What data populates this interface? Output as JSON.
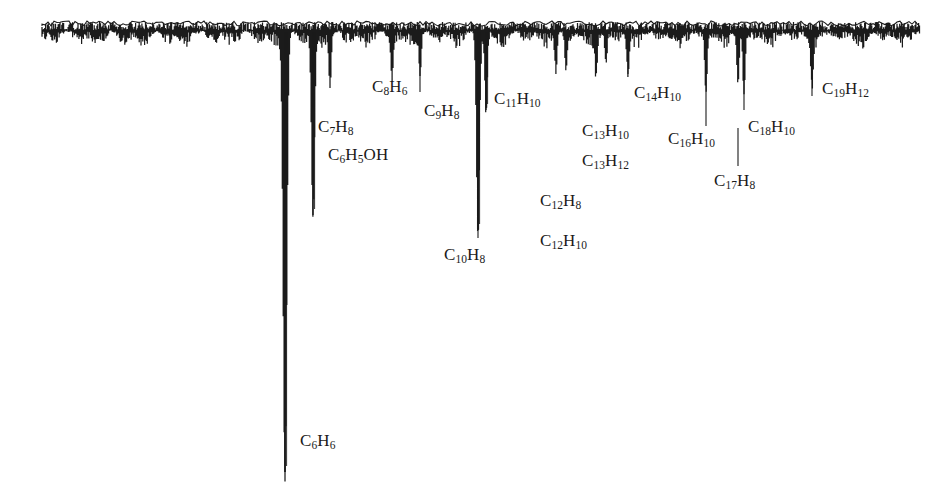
{
  "figure": {
    "kind": "gas-chromatogram",
    "orientation": "inverted-peaks-downward",
    "ink_color": "#1b1b1b",
    "background_color": "#ffffff",
    "baseline_y": 30,
    "trace_start_x": 42,
    "trace_end_x": 920
  },
  "labels": [
    {
      "name": "c6h6",
      "text": "C6H6",
      "formula": [
        [
          "C",
          ""
        ],
        [
          "",
          6
        ],
        [
          "H",
          ""
        ],
        [
          "",
          6
        ]
      ],
      "x": 300,
      "y": 432,
      "leader_x": 285,
      "leader_y1": 408,
      "leader_y2": 472
    },
    {
      "name": "c7h8",
      "text": "C7H8",
      "formula": [
        [
          "C",
          ""
        ],
        [
          "",
          7
        ],
        [
          "H",
          ""
        ],
        [
          "",
          8
        ]
      ],
      "x": 318,
      "y": 118,
      "leader_x": 313,
      "leader_y1": 62,
      "leader_y2": 108
    },
    {
      "name": "c6h5oh",
      "text": "C6H5OH",
      "formula": [
        [
          "C",
          ""
        ],
        [
          "",
          6
        ],
        [
          "H",
          ""
        ],
        [
          "",
          5
        ],
        [
          "OH",
          ""
        ]
      ],
      "x": 328,
      "y": 146,
      "leader_x": null,
      "leader_y1": null,
      "leader_y2": null
    },
    {
      "name": "c8h6",
      "text": "C8H6",
      "formula": [
        [
          "C",
          ""
        ],
        [
          "",
          8
        ],
        [
          "H",
          ""
        ],
        [
          "",
          6
        ]
      ],
      "x": 372,
      "y": 78,
      "leader_x": null,
      "leader_y1": null,
      "leader_y2": null
    },
    {
      "name": "c9h8",
      "text": "C9H8",
      "formula": [
        [
          "C",
          ""
        ],
        [
          "",
          9
        ],
        [
          "H",
          ""
        ],
        [
          "",
          8
        ]
      ],
      "x": 424,
      "y": 102,
      "leader_x": 420,
      "leader_y1": 58,
      "leader_y2": 92
    },
    {
      "name": "c10h8",
      "text": "C10H8",
      "formula": [
        [
          "C",
          ""
        ],
        [
          "",
          10
        ],
        [
          "H",
          ""
        ],
        [
          "",
          8
        ]
      ],
      "x": 444,
      "y": 246,
      "leader_x": 478,
      "leader_y1": 196,
      "leader_y2": 238
    },
    {
      "name": "c11h10",
      "text": "C11H10",
      "formula": [
        [
          "C",
          ""
        ],
        [
          "",
          11
        ],
        [
          "H",
          ""
        ],
        [
          "",
          10
        ]
      ],
      "x": 494,
      "y": 90,
      "leader_x": 486,
      "leader_y1": 40,
      "leader_y2": 108
    },
    {
      "name": "c12h8",
      "text": "C12H8",
      "formula": [
        [
          "C",
          ""
        ],
        [
          "",
          12
        ],
        [
          "H",
          ""
        ],
        [
          "",
          8
        ]
      ],
      "x": 540,
      "y": 192,
      "leader_x": null,
      "leader_y1": null,
      "leader_y2": null
    },
    {
      "name": "c12h10",
      "text": "C12H10",
      "formula": [
        [
          "C",
          ""
        ],
        [
          "",
          12
        ],
        [
          "H",
          ""
        ],
        [
          "",
          10
        ]
      ],
      "x": 540,
      "y": 232,
      "leader_x": null,
      "leader_y1": null,
      "leader_y2": null
    },
    {
      "name": "c13h10",
      "text": "C13H10",
      "formula": [
        [
          "C",
          ""
        ],
        [
          "",
          13
        ],
        [
          "H",
          ""
        ],
        [
          "",
          10
        ]
      ],
      "x": 582,
      "y": 122,
      "leader_x": null,
      "leader_y1": null,
      "leader_y2": null
    },
    {
      "name": "c13h12",
      "text": "C13H12",
      "formula": [
        [
          "C",
          ""
        ],
        [
          "",
          13
        ],
        [
          "H",
          ""
        ],
        [
          "",
          12
        ]
      ],
      "x": 582,
      "y": 152,
      "leader_x": null,
      "leader_y1": null,
      "leader_y2": null
    },
    {
      "name": "c14h10",
      "text": "C14H10",
      "formula": [
        [
          "C",
          ""
        ],
        [
          "",
          14
        ],
        [
          "H",
          ""
        ],
        [
          "",
          10
        ]
      ],
      "x": 634,
      "y": 84,
      "leader_x": 628,
      "leader_y1": 44,
      "leader_y2": 74
    },
    {
      "name": "c16h10",
      "text": "C16H10",
      "formula": [
        [
          "C",
          ""
        ],
        [
          "",
          16
        ],
        [
          "H",
          ""
        ],
        [
          "",
          10
        ]
      ],
      "x": 668,
      "y": 130,
      "leader_x": 706,
      "leader_y1": 60,
      "leader_y2": 126
    },
    {
      "name": "c17h8",
      "text": "C17H8",
      "formula": [
        [
          "C",
          ""
        ],
        [
          "",
          17
        ],
        [
          "H",
          ""
        ],
        [
          "",
          8
        ]
      ],
      "x": 714,
      "y": 172,
      "leader_x": 738,
      "leader_y1": 128,
      "leader_y2": 166
    },
    {
      "name": "c18h10",
      "text": "C18H10",
      "formula": [
        [
          "C",
          ""
        ],
        [
          "",
          18
        ],
        [
          "H",
          ""
        ],
        [
          "",
          10
        ]
      ],
      "x": 748,
      "y": 118,
      "leader_x": 744,
      "leader_y1": 60,
      "leader_y2": 110
    },
    {
      "name": "c19h12",
      "text": "C19H12",
      "formula": [
        [
          "C",
          ""
        ],
        [
          "",
          19
        ],
        [
          "H",
          ""
        ],
        [
          "",
          12
        ]
      ],
      "x": 822,
      "y": 80,
      "leader_x": 812,
      "leader_y1": 60,
      "leader_y2": 96
    }
  ],
  "chart_data": {
    "type": "line",
    "title": "",
    "subtitle": "",
    "xlabel": "",
    "ylabel": "",
    "grid": false,
    "legend": null,
    "orientation": "peaks point downward from a top baseline",
    "xlim": [
      42,
      920
    ],
    "ylim_pixels": [
      30,
      487
    ],
    "baseline_y": 30,
    "named_peaks": [
      {
        "label": "C6H6",
        "x": 285,
        "depth_px": 442,
        "relative_depth": 1.0
      },
      {
        "label": "C7H8",
        "x": 313,
        "depth_px": 185,
        "relative_depth": 0.42
      },
      {
        "label": "C6H5OH",
        "x": 330,
        "depth_px": 55,
        "relative_depth": 0.12
      },
      {
        "label": "C8H6",
        "x": 392,
        "depth_px": 48,
        "relative_depth": 0.11
      },
      {
        "label": "C9H8",
        "x": 420,
        "depth_px": 40,
        "relative_depth": 0.09
      },
      {
        "label": "C10H8",
        "x": 478,
        "depth_px": 200,
        "relative_depth": 0.45
      },
      {
        "label": "C11H10",
        "x": 486,
        "depth_px": 80,
        "relative_depth": 0.18
      },
      {
        "label": "C12H8",
        "x": 556,
        "depth_px": 38,
        "relative_depth": 0.09
      },
      {
        "label": "C12H10",
        "x": 566,
        "depth_px": 34,
        "relative_depth": 0.08
      },
      {
        "label": "C13H10",
        "x": 596,
        "depth_px": 36,
        "relative_depth": 0.08
      },
      {
        "label": "C13H12",
        "x": 606,
        "depth_px": 32,
        "relative_depth": 0.07
      },
      {
        "label": "C14H10",
        "x": 628,
        "depth_px": 42,
        "relative_depth": 0.1
      },
      {
        "label": "C16H10",
        "x": 706,
        "depth_px": 58,
        "relative_depth": 0.13
      },
      {
        "label": "C17H8",
        "x": 738,
        "depth_px": 52,
        "relative_depth": 0.12
      },
      {
        "label": "C18H10",
        "x": 744,
        "depth_px": 60,
        "relative_depth": 0.14
      },
      {
        "label": "C19H12",
        "x": 812,
        "depth_px": 44,
        "relative_depth": 0.1
      }
    ]
  }
}
